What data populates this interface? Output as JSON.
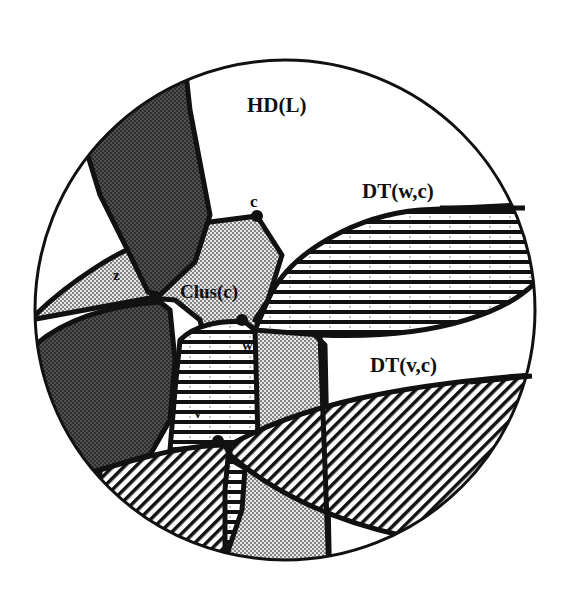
{
  "figure": {
    "type": "schematic region diagram",
    "boundary": "circle",
    "labels": {
      "hd": "HD(L)",
      "dt_wc": "DT(w,c)",
      "dt_vc": "DT(v,c)",
      "clus": "Clus(c)",
      "c": "c",
      "z": "z",
      "w": "w",
      "v": "v"
    },
    "points": [
      {
        "name": "c",
        "x": 257,
        "y": 216
      },
      {
        "name": "z",
        "x": 155,
        "y": 297
      },
      {
        "name": "w",
        "x": 242,
        "y": 320
      },
      {
        "name": "v",
        "x": 218,
        "y": 441
      }
    ],
    "colors": {
      "ink": "#111111",
      "dark_fill": "#3a3a3a",
      "light_fill": "#c8c8c8",
      "background": "#ffffff"
    },
    "fill_patterns": {
      "dark_regions": "dense dark stipple",
      "cluster": "light stipple",
      "dt_wc": "horizontal stripes",
      "dt_vc": "diagonal stripes"
    }
  }
}
